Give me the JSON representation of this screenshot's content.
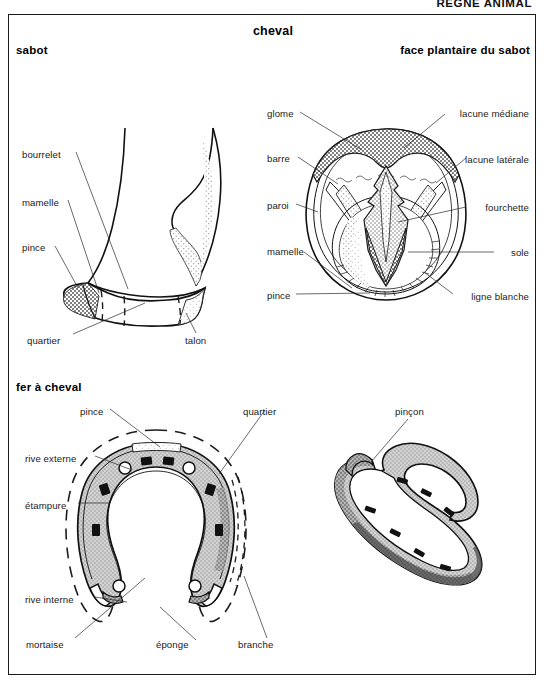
{
  "page": {
    "header": "RÈGNE ANIMAL",
    "background": "#ffffff",
    "frame_color": "#1b1b1b"
  },
  "titles": {
    "main": "cheval",
    "sabot": "sabot",
    "face_plantaire": "face plantaire du sabot",
    "fer": "fer à cheval"
  },
  "figures": {
    "sabot": {
      "name": "sabot",
      "labels_left": [
        {
          "text": "bourrelet",
          "x": 22,
          "y": 155
        },
        {
          "text": "mamelle",
          "x": 22,
          "y": 203
        },
        {
          "text": "pince",
          "x": 22,
          "y": 248
        }
      ],
      "labels_bottom": [
        {
          "text": "quartier",
          "x": 27,
          "y": 341
        },
        {
          "text": "talon",
          "x": 185,
          "y": 341
        }
      ]
    },
    "face_plantaire": {
      "name": "face plantaire du sabot",
      "labels_left": [
        {
          "text": "glome",
          "x": 267,
          "y": 114
        },
        {
          "text": "barre",
          "x": 267,
          "y": 159
        },
        {
          "text": "paroi",
          "x": 267,
          "y": 206
        },
        {
          "text": "mamelle",
          "x": 267,
          "y": 252
        },
        {
          "text": "pince",
          "x": 267,
          "y": 296
        }
      ],
      "labels_right": [
        {
          "text": "lacune médiane",
          "x": 529,
          "y": 114
        },
        {
          "text": "lacune latérale",
          "x": 529,
          "y": 160
        },
        {
          "text": "fourchette",
          "x": 529,
          "y": 208
        },
        {
          "text": "sole",
          "x": 529,
          "y": 253
        },
        {
          "text": "ligne blanche",
          "x": 529,
          "y": 297
        }
      ]
    },
    "fer_a_cheval": {
      "name": "fer à cheval",
      "labels": [
        {
          "text": "pince",
          "x": 80,
          "y": 412,
          "align": "left"
        },
        {
          "text": "quartier",
          "x": 243,
          "y": 412,
          "align": "left"
        },
        {
          "text": "rive externe",
          "x": 25,
          "y": 459,
          "align": "left"
        },
        {
          "text": "étampure",
          "x": 25,
          "y": 506,
          "align": "left"
        },
        {
          "text": "rive interne",
          "x": 25,
          "y": 600,
          "align": "left"
        },
        {
          "text": "mortaise",
          "x": 26,
          "y": 645,
          "align": "left"
        },
        {
          "text": "éponge",
          "x": 156,
          "y": 645,
          "align": "left"
        },
        {
          "text": "branche",
          "x": 238,
          "y": 645,
          "align": "left"
        }
      ]
    },
    "fer_perspective": {
      "name": "fer à cheval en perspective",
      "labels": [
        {
          "text": "pinçon",
          "x": 395,
          "y": 412,
          "align": "left"
        }
      ]
    }
  },
  "colors": {
    "ink": "#1a1a1a",
    "hatch_dark": "#6f6f6f",
    "hatch_mid": "#9a9a9a",
    "hatch_light": "#c9c9c9",
    "paper": "#ffffff"
  }
}
